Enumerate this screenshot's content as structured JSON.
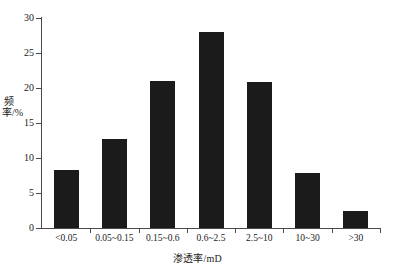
{
  "chart_data": {
    "type": "bar",
    "title": "",
    "xlabel": "渗透率/mD",
    "ylabel": "频率/%",
    "categories": [
      "<0.05",
      "0.05~0.15",
      "0.15~0.6",
      "0.6~2.5",
      "2.5~10",
      "10~30",
      ">30"
    ],
    "values": [
      8.3,
      12.7,
      21.0,
      28.0,
      20.8,
      7.9,
      2.5
    ],
    "ylim": [
      0,
      30
    ],
    "yticks": [
      0,
      5,
      10,
      15,
      20,
      25,
      30
    ],
    "ytick_labels": [
      "0",
      "5",
      "10",
      "15",
      "20",
      "25",
      "30"
    ],
    "grid": false,
    "legend": null,
    "bar_color": "#1b1b1b",
    "axis_color": "#4a4a4a",
    "background": "#ffffff"
  }
}
